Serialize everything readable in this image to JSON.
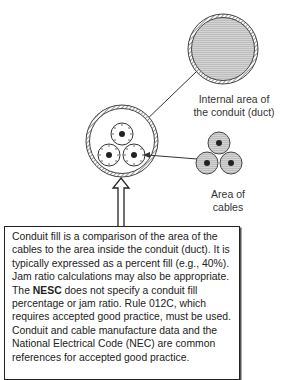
{
  "diagram": {
    "labels": {
      "conduit_internal_area_line1": "Internal area of",
      "conduit_internal_area_line2": "the conduit (duct)",
      "cables_area_line1": "Area of",
      "cables_area_line2": "cables"
    },
    "note": {
      "text_before": "Conduit fill is a comparison of the area of the cables to the area inside the conduit (duct). It is typically expressed as a percent fill (e.g., 40%). Jam ratio calculations may also be appropriate. The ",
      "bold": "NESC",
      "text_after": " does not specify a conduit fill percentage or jam ratio. Rule 012C, which requires accepted good practice, must be used. Conduit and cable manufacture data and the National Electrical Code (NEC) are common references for accepted good practice."
    },
    "example_fill_percent": "40%",
    "rule": "012C",
    "colors": {
      "line": "#333333",
      "fill_gray": "#c8c8c8",
      "cable_core": "#222222"
    }
  }
}
